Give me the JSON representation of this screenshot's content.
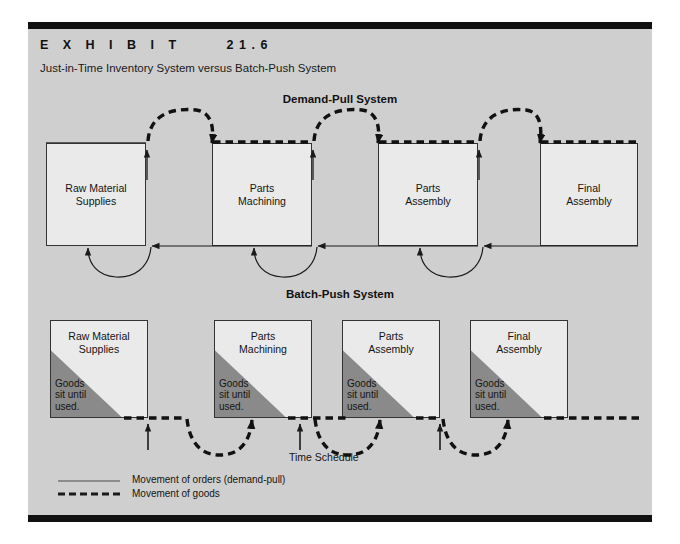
{
  "exhibit": {
    "label": "E X H I B I T     21.6",
    "subtitle": "Just-in-Time Inventory System versus Batch-Push System"
  },
  "sections": {
    "demand_pull": {
      "title": "Demand-Pull System"
    },
    "batch_push": {
      "title": "Batch-Push System"
    }
  },
  "demand_pull_boxes": [
    {
      "line1": "Raw Material",
      "line2": "Supplies"
    },
    {
      "line1": "Parts",
      "line2": "Machining"
    },
    {
      "line1": "Parts",
      "line2": "Assembly"
    },
    {
      "line1": "Final",
      "line2": "Assembly"
    }
  ],
  "batch_push_boxes": [
    {
      "line1": "Raw Material",
      "line2": "Supplies",
      "note1": "Goods",
      "note2": "sit until",
      "note3": "used."
    },
    {
      "line1": "Parts",
      "line2": "Machining",
      "note1": "Goods",
      "note2": "sit until",
      "note3": "used."
    },
    {
      "line1": "Parts",
      "line2": "Assembly",
      "note1": "Goods",
      "note2": "sit until",
      "note3": "used."
    },
    {
      "line1": "Final",
      "line2": "Assembly",
      "note1": "Goods",
      "note2": "sit until",
      "note3": "used."
    }
  ],
  "time_schedule": {
    "label": "Time Schedule"
  },
  "legend": {
    "orders": "Movement of orders (demand-pull)",
    "goods": "Movement of goods"
  },
  "colors": {
    "panel": "#cfcfcf",
    "rule": "#111111",
    "box_fill": "#eaeaea",
    "box_border": "#333333",
    "triangle": "#8a8a8a",
    "line": "#1a1a1a"
  }
}
